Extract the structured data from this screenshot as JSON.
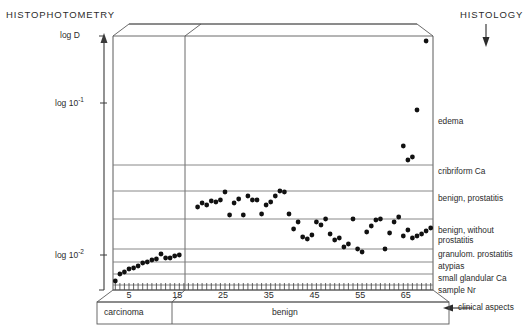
{
  "titles": {
    "left": "HISTOPHOTOMETRY",
    "right": "HISTOLOGY",
    "bottom_note": "clinical aspects"
  },
  "axes": {
    "y_axis_label": "log D",
    "y_ticks": [
      {
        "label_main": "log 10",
        "label_exp": "-1",
        "value": -1,
        "y_px": 103
      },
      {
        "label_main": "log 10",
        "label_exp": "-2",
        "value": -2,
        "y_px": 255
      }
    ],
    "x_axis_label": "sample Nr",
    "x_ticks": [
      5,
      15,
      25,
      35,
      45,
      55,
      65
    ],
    "x_minor_tick_count": 70
  },
  "right_labels": [
    {
      "text": "edema",
      "y_px": 122
    },
    {
      "text": "cribriform Ca",
      "y_px": 172
    },
    {
      "text": "benign, prostatitis",
      "y_px": 199
    },
    {
      "text": "benign, without",
      "y_px": 231
    },
    {
      "text": "prostatitis",
      "y_px": 241
    },
    {
      "text": "granulom. prostatitis",
      "y_px": 255
    },
    {
      "text": "atypias",
      "y_px": 267
    },
    {
      "text": "small glandular Ca",
      "y_px": 279
    },
    {
      "text": "sample Nr",
      "y_px": 291
    }
  ],
  "bands": [
    {
      "label": "carcinoma",
      "from": 1,
      "to": 11
    },
    {
      "label": "benign",
      "from": 11,
      "to": 70
    }
  ],
  "colors": {
    "line": "#4d4d4d",
    "grid": "#6e6e6e",
    "point": "#111111",
    "text": "#2b2b2b",
    "background": "#ffffff"
  },
  "chart_data": {
    "type": "scatter",
    "xlabel": "sample Nr",
    "ylabel": "log D",
    "xlim": [
      0,
      70
    ],
    "ylim_log": [
      0.0055,
      1.0
    ],
    "grid": true,
    "legend": "none",
    "annotations": [
      "edema",
      "cribriform Ca",
      "benign, prostatitis",
      "benign, without prostatitis",
      "granulom. prostatitis",
      "atypias",
      "small glandular Ca",
      "clinical aspects"
    ],
    "group_separator_x": 11,
    "points": [
      {
        "x": 1,
        "y_px": 281
      },
      {
        "x": 2,
        "y_px": 274
      },
      {
        "x": 3,
        "y_px": 272
      },
      {
        "x": 4,
        "y_px": 269
      },
      {
        "x": 5,
        "y_px": 268
      },
      {
        "x": 6,
        "y_px": 266
      },
      {
        "x": 7,
        "y_px": 263
      },
      {
        "x": 8,
        "y_px": 262
      },
      {
        "x": 9,
        "y_px": 260
      },
      {
        "x": 10,
        "y_px": 259
      },
      {
        "x": 11,
        "y_px": 254
      },
      {
        "x": 12,
        "y_px": 258
      },
      {
        "x": 13,
        "y_px": 258
      },
      {
        "x": 14,
        "y_px": 256
      },
      {
        "x": 15,
        "y_px": 255
      },
      {
        "x": 19,
        "y_px": 207
      },
      {
        "x": 20,
        "y_px": 203
      },
      {
        "x": 21,
        "y_px": 205
      },
      {
        "x": 22,
        "y_px": 201
      },
      {
        "x": 23,
        "y_px": 202
      },
      {
        "x": 24,
        "y_px": 200
      },
      {
        "x": 25,
        "y_px": 192
      },
      {
        "x": 26,
        "y_px": 215
      },
      {
        "x": 27,
        "y_px": 203
      },
      {
        "x": 28,
        "y_px": 199
      },
      {
        "x": 29,
        "y_px": 215
      },
      {
        "x": 30,
        "y_px": 196
      },
      {
        "x": 31,
        "y_px": 200
      },
      {
        "x": 32,
        "y_px": 200
      },
      {
        "x": 33,
        "y_px": 214
      },
      {
        "x": 34,
        "y_px": 205
      },
      {
        "x": 35,
        "y_px": 202
      },
      {
        "x": 36,
        "y_px": 196
      },
      {
        "x": 37,
        "y_px": 191
      },
      {
        "x": 38,
        "y_px": 192
      },
      {
        "x": 39,
        "y_px": 214
      },
      {
        "x": 40,
        "y_px": 229
      },
      {
        "x": 41,
        "y_px": 222
      },
      {
        "x": 42,
        "y_px": 237
      },
      {
        "x": 43,
        "y_px": 239
      },
      {
        "x": 44,
        "y_px": 235
      },
      {
        "x": 45,
        "y_px": 222
      },
      {
        "x": 46,
        "y_px": 225
      },
      {
        "x": 47,
        "y_px": 219
      },
      {
        "x": 48,
        "y_px": 234
      },
      {
        "x": 49,
        "y_px": 240
      },
      {
        "x": 50,
        "y_px": 238
      },
      {
        "x": 51,
        "y_px": 247
      },
      {
        "x": 52,
        "y_px": 244
      },
      {
        "x": 53,
        "y_px": 219
      },
      {
        "x": 54,
        "y_px": 249
      },
      {
        "x": 55,
        "y_px": 252
      },
      {
        "x": 56,
        "y_px": 232
      },
      {
        "x": 57,
        "y_px": 226
      },
      {
        "x": 58,
        "y_px": 220
      },
      {
        "x": 59,
        "y_px": 219
      },
      {
        "x": 60,
        "y_px": 249
      },
      {
        "x": 61,
        "y_px": 233
      },
      {
        "x": 62,
        "y_px": 222
      },
      {
        "x": 63,
        "y_px": 217
      },
      {
        "x": 64,
        "y_px": 236
      },
      {
        "x": 65,
        "y_px": 230
      },
      {
        "x": 66,
        "y_px": 238
      },
      {
        "x": 67,
        "y_px": 236
      },
      {
        "x": 68,
        "y_px": 234
      },
      {
        "x": 69,
        "y_px": 231
      },
      {
        "x": 70,
        "y_px": 228
      },
      {
        "x": 65,
        "y_px": 160
      },
      {
        "x": 66,
        "y_px": 157
      },
      {
        "x": 64,
        "y_px": 146
      },
      {
        "x": 67,
        "y_px": 110
      },
      {
        "x": 69,
        "y_px": 41
      }
    ]
  }
}
